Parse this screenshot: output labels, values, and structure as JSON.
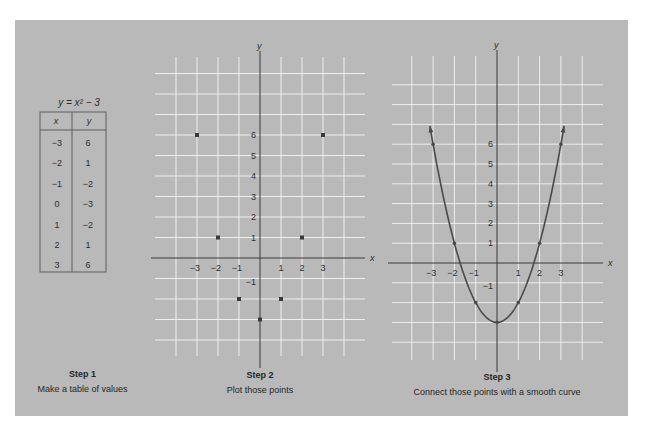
{
  "colors": {
    "panel_bg": "#b9b9b9",
    "grid": "#f4f4f4",
    "axis": "#3a3a3a",
    "point": "#3a3a3a",
    "curve": "#4a4a4a"
  },
  "step1": {
    "step_label": "Step 1",
    "description": "Make a table of values",
    "table_title": "y = x² − 3",
    "headers": [
      "x",
      "y"
    ],
    "rows": [
      [
        "−3",
        "6"
      ],
      [
        "−2",
        "1"
      ],
      [
        "−1",
        "−2"
      ],
      [
        "0",
        "−3"
      ],
      [
        "1",
        "−2"
      ],
      [
        "2",
        "1"
      ],
      [
        "3",
        "6"
      ]
    ]
  },
  "step2": {
    "step_label": "Step 2",
    "description": "Plot those points",
    "x_axis_label": "x",
    "y_axis_label": "y"
  },
  "step3": {
    "step_label": "Step 3",
    "description": "Connect those points with a smooth curve",
    "x_axis_label": "x",
    "y_axis_label": "y"
  },
  "chart_data": [
    {
      "type": "scatter",
      "title": "Step 2 — Plot those points",
      "xlabel": "x",
      "ylabel": "y",
      "x_ticks": [
        -3,
        -2,
        -1,
        1,
        2,
        3
      ],
      "y_ticks": [
        -1,
        1,
        2,
        3,
        4,
        5,
        6
      ],
      "grid": true,
      "xlim": [
        -4,
        4
      ],
      "ylim": [
        -5,
        9
      ],
      "x": [
        -3,
        -2,
        -1,
        0,
        1,
        2,
        3
      ],
      "y": [
        6,
        1,
        -2,
        -3,
        -2,
        1,
        6
      ]
    },
    {
      "type": "line",
      "title": "Step 3 — Connect those points with a smooth curve",
      "equation": "y = x^2 - 3",
      "xlabel": "x",
      "ylabel": "y",
      "x_ticks": [
        -3,
        -2,
        -1,
        1,
        2,
        3
      ],
      "y_ticks": [
        -1,
        1,
        2,
        3,
        4,
        5,
        6
      ],
      "grid": true,
      "xlim": [
        -4,
        4
      ],
      "ylim": [
        -5,
        9
      ],
      "x": [
        -3,
        -2,
        -1,
        0,
        1,
        2,
        3
      ],
      "y": [
        6,
        1,
        -2,
        -3,
        -2,
        1,
        6
      ],
      "arrows_at_ends": true
    }
  ]
}
